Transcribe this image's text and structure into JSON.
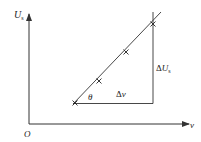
{
  "diagram": {
    "type": "graph",
    "axes": {
      "y_label": "U",
      "y_label_sub": "s",
      "x_label": "v",
      "origin_label": "O"
    },
    "line": {
      "points_marked": 4,
      "slope_angle_label": "θ"
    },
    "triangle": {
      "horizontal_label_delta": "Δ",
      "horizontal_label_var": "v",
      "vertical_label_delta": "Δ",
      "vertical_label_var": "U",
      "vertical_label_sub": "s"
    },
    "colors": {
      "stroke": "#333333",
      "text": "#222222",
      "background": "#ffffff"
    }
  }
}
